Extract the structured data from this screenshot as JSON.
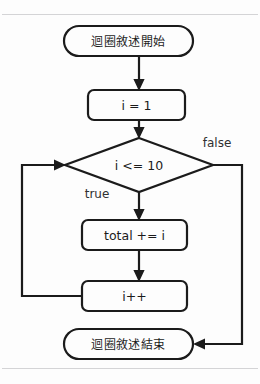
{
  "diagram": {
    "language": "zh-Hant",
    "colors": {
      "background": "#fdfdfd",
      "stroke": "#1b1b1b",
      "node_fill": "#fdfdfd",
      "label_text": "#1b1b1b",
      "edge_label_text": "#303030",
      "page_rule": "#d4d4d6"
    },
    "nodes": [
      {
        "id": "start",
        "type": "terminator",
        "label": "迴圈敘述開始",
        "x": 64,
        "y": 26,
        "width": 129,
        "height": 30,
        "rx": 15
      },
      {
        "id": "init",
        "type": "process",
        "label": "i = 1",
        "x": 88,
        "y": 90,
        "width": 97,
        "height": 30,
        "rx": 6
      },
      {
        "id": "condition",
        "type": "decision",
        "label": "i <= 10",
        "cx": 139,
        "cy": 165,
        "half_width": 74,
        "half_height": 27
      },
      {
        "id": "accumulate",
        "type": "process",
        "label": "total += i",
        "x": 82,
        "y": 220,
        "width": 105,
        "height": 30,
        "rx": 6
      },
      {
        "id": "increment",
        "type": "process",
        "label": "i++",
        "x": 82,
        "y": 281,
        "width": 105,
        "height": 30,
        "rx": 6
      },
      {
        "id": "end",
        "type": "terminator",
        "label": "迴圈敘述結束",
        "x": 64,
        "y": 329,
        "width": 129,
        "height": 30,
        "rx": 15
      }
    ],
    "edge_labels": [
      {
        "id": "false-label",
        "text": "false",
        "x": 217,
        "y": 143
      },
      {
        "id": "true-label",
        "text": "true",
        "x": 97,
        "y": 194
      }
    ],
    "edges": [
      {
        "id": "start-to-init",
        "from": "start",
        "to": "init",
        "label": ""
      },
      {
        "id": "init-to-condition",
        "from": "init",
        "to": "condition",
        "label": ""
      },
      {
        "id": "condition-to-accumulate",
        "from": "condition",
        "to": "accumulate",
        "label": "true"
      },
      {
        "id": "accumulate-to-increment",
        "from": "accumulate",
        "to": "increment",
        "label": ""
      },
      {
        "id": "increment-to-condition",
        "from": "increment",
        "to": "condition",
        "label": ""
      },
      {
        "id": "condition-to-end",
        "from": "condition",
        "to": "end",
        "label": "false"
      }
    ]
  }
}
